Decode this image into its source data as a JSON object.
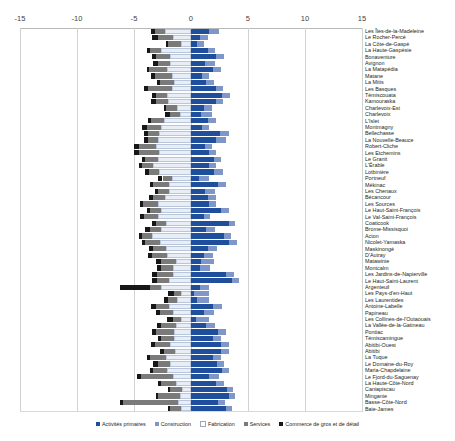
{
  "chart_data": {
    "type": "bar",
    "title": "",
    "subtitle": "",
    "xlabel": "",
    "ylabel": "",
    "orientation": "horizontal",
    "stacked": true,
    "diverging": true,
    "grid": true,
    "legend_position": "bottom",
    "xlim": [
      -15,
      15
    ],
    "xticks": [
      -15,
      -10,
      -5,
      0,
      5,
      10,
      15
    ],
    "xtick_labels": [
      "-15",
      "-10",
      "-5",
      "0",
      "5",
      "10",
      "15"
    ],
    "series_names": [
      "Activités primaires",
      "Construction",
      "Fabrication",
      "Services",
      "Commerce de gros et de détail"
    ],
    "series_colors": [
      "#1f4e9c",
      "#7e97c8",
      "#e8eef7",
      "#7a7a7a",
      "#171717"
    ],
    "categories": [
      "Les Îles-de-la-Madeleine",
      "Le Rocher-Percé",
      "La Côte-de-Gaspé",
      "La Haute-Gaspésie",
      "Bonaventure",
      "Avignon",
      "La Matapédia",
      "Matane",
      "La Mitis",
      "Les Basques",
      "Témiscouata",
      "Kamouraska",
      "Charlevoix-Est",
      "Charlevoix",
      "L'Islet",
      "Montmagny",
      "Bellechasse",
      "La Nouvelle-Beauce",
      "Robert-Cliche",
      "Les Etchemins",
      "Le Granit",
      "L'Érable",
      "Lotbinière",
      "Portneuf",
      "Mékinac",
      "Les Chenaux",
      "Bécancour",
      "Les Sources",
      "Le Haut-Saint-François",
      "Le Val-Saint-François",
      "Coaticook",
      "Brome-Missisquoi",
      "Acton",
      "Nicolet-Yamaska",
      "Maskinongé",
      "D'Autray",
      "Matawinie",
      "Montcalm",
      "Les Jardins-de-Napierville",
      "Le Haut-Saint-Laurent",
      "Argenteuil",
      "Les Pays-d'en-Haut",
      "Les Laurentides",
      "Antoine-Labelle",
      "Papineau",
      "Les Collines-de-l'Outaouais",
      "La Vallée-de-la-Gatineau",
      "Pontiac",
      "Témiscamingue",
      "Abitibi-Ouest",
      "Abitibi",
      "La Tuque",
      "Le Domaine-du-Roy",
      "Maria-Chapdelaine",
      "Le Fjord-du-Saguenay",
      "La Haute-Côte-Nord",
      "Caniapiscau",
      "Minganie",
      "Basse-Côte-Nord",
      "Baie-James"
    ],
    "series": [
      {
        "name": "Activités primaires",
        "values": [
          1.6,
          0.8,
          0.5,
          1.5,
          2.2,
          1.2,
          1.9,
          1.0,
          1.3,
          2.2,
          2.7,
          2.2,
          1.1,
          0.9,
          1.5,
          1.0,
          2.5,
          2.2,
          1.2,
          1.6,
          2.0,
          1.6,
          2.0,
          0.7,
          2.4,
          1.2,
          1.5,
          1.6,
          2.6,
          1.1,
          3.3,
          1.3,
          2.9,
          3.3,
          1.5,
          1.1,
          0.9,
          0.8,
          3.1,
          3.6,
          0.8,
          0.3,
          0.5,
          1.9,
          1.1,
          0.4,
          1.3,
          2.4,
          1.9,
          2.6,
          2.6,
          1.9,
          2.3,
          2.7,
          1.6,
          2.2,
          3.2,
          3.3,
          2.4,
          3.1
        ]
      },
      {
        "name": "Construction",
        "values": [
          0.9,
          0.7,
          0.6,
          0.6,
          0.7,
          0.9,
          0.7,
          0.6,
          0.7,
          0.6,
          0.7,
          0.6,
          0.7,
          0.9,
          0.7,
          0.6,
          0.8,
          0.9,
          0.6,
          0.6,
          0.6,
          0.6,
          0.8,
          0.9,
          0.7,
          0.9,
          0.7,
          0.6,
          0.7,
          0.6,
          0.6,
          0.8,
          0.6,
          0.7,
          0.8,
          0.8,
          1.1,
          0.9,
          0.7,
          0.6,
          0.8,
          1.3,
          1.1,
          0.8,
          0.9,
          1.2,
          0.8,
          0.7,
          0.7,
          0.7,
          0.7,
          0.7,
          0.6,
          0.6,
          0.9,
          0.7,
          0.5,
          0.6,
          0.6,
          0.5
        ]
      },
      {
        "name": "Fabrication",
        "values": [
          -2.3,
          -1.6,
          -0.9,
          -2.6,
          -1.8,
          -1.8,
          -2.1,
          -1.7,
          -1.5,
          -1.7,
          -2.1,
          -2.0,
          -1.2,
          -1.0,
          -2.4,
          -2.6,
          -2.8,
          -2.9,
          -3.1,
          -2.8,
          -2.9,
          -3.3,
          -2.8,
          -1.7,
          -1.9,
          -1.9,
          -2.3,
          -2.9,
          -2.6,
          -2.9,
          -2.2,
          -2.6,
          -3.4,
          -2.7,
          -2.2,
          -2.1,
          -1.3,
          -1.6,
          -1.6,
          -1.9,
          -2.6,
          -0.9,
          -1.2,
          -1.9,
          -1.6,
          -0.9,
          -1.3,
          -1.5,
          -1.5,
          -1.8,
          -1.4,
          -2.2,
          -1.8,
          -2.1,
          -1.6,
          -1.3,
          -0.8,
          -1.0,
          -1.1,
          -0.9
        ]
      },
      {
        "name": "Services",
        "values": [
          -0.9,
          -1.3,
          -1.1,
          -1.0,
          -1.3,
          -1.1,
          -1.6,
          -1.5,
          -1.2,
          -2.1,
          -1.0,
          -1.1,
          -1.0,
          -0.8,
          -1.1,
          -1.3,
          -1.0,
          -0.9,
          -1.5,
          -1.8,
          -1.1,
          -1.0,
          -0.9,
          -0.8,
          -1.4,
          -1.0,
          -1.0,
          -1.3,
          -1.0,
          -1.2,
          -0.9,
          -1.0,
          -0.9,
          -1.3,
          -1.1,
          -1.3,
          -1.3,
          -1.0,
          -1.4,
          -1.1,
          -1.0,
          -0.6,
          -0.8,
          -1.2,
          -1.1,
          -0.7,
          -1.3,
          -1.6,
          -1.1,
          -1.4,
          -1.0,
          -1.4,
          -1.1,
          -1.2,
          -2.8,
          -1.3,
          -1.0,
          -1.9,
          -4.9,
          -0.9
        ]
      },
      {
        "name": "Commerce de gros et de détail",
        "values": [
          -0.3,
          -0.5,
          -0.2,
          -0.3,
          -0.3,
          -0.4,
          -0.2,
          -0.3,
          -0.3,
          -0.3,
          -0.3,
          -0.4,
          -0.2,
          -0.5,
          -0.3,
          -0.4,
          -0.3,
          -0.3,
          -0.4,
          -0.4,
          -0.3,
          -0.3,
          -0.3,
          -0.4,
          -0.3,
          -0.3,
          -0.4,
          -0.3,
          -0.3,
          -0.4,
          -0.3,
          -0.4,
          -0.3,
          -0.3,
          -0.4,
          -0.4,
          -0.5,
          -0.4,
          -0.4,
          -0.4,
          -2.6,
          -0.5,
          -0.4,
          -0.4,
          -0.4,
          -0.5,
          -0.4,
          -0.3,
          -0.3,
          -0.3,
          -0.3,
          -0.3,
          -0.4,
          -0.3,
          -0.3,
          -0.3,
          -0.2,
          -0.2,
          -0.2,
          -0.2
        ]
      }
    ]
  }
}
